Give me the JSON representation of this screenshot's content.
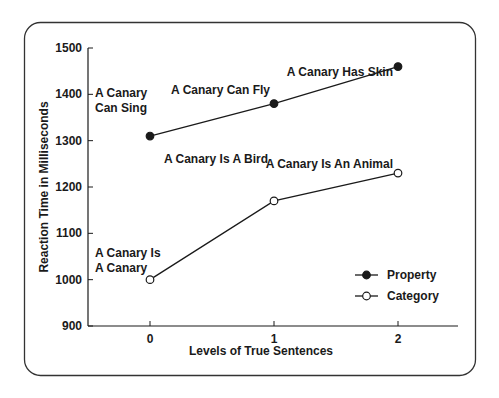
{
  "chart_data": {
    "type": "line",
    "title": "",
    "xlabel": "Levels of True Sentences",
    "ylabel": "Reaction Time in Milliseconds",
    "categories": [
      "0",
      "1",
      "2"
    ],
    "x": [
      0,
      1,
      2
    ],
    "ylim": [
      900,
      1500
    ],
    "yticks": [
      900,
      1000,
      1100,
      1200,
      1300,
      1400,
      1500
    ],
    "grid": false,
    "legend_position": "lower right",
    "series": [
      {
        "name": "Property",
        "marker": "filled-circle",
        "values": [
          1310,
          1380,
          1460
        ],
        "point_labels": [
          [
            "A Canary",
            "Can Sing"
          ],
          [
            "A Canary Can Fly"
          ],
          [
            "A Canary Has Skin"
          ]
        ]
      },
      {
        "name": "Category",
        "marker": "open-circle",
        "values": [
          1000,
          1170,
          1230
        ],
        "point_labels": [
          [
            "A Canary Is",
            "A Canary"
          ],
          [
            "A Canary Is A Bird"
          ],
          [
            "A Canary Is An Animal"
          ]
        ]
      }
    ]
  },
  "colors": {
    "line": "#1a1a1a",
    "frame": "#333333",
    "background": "#ffffff"
  }
}
